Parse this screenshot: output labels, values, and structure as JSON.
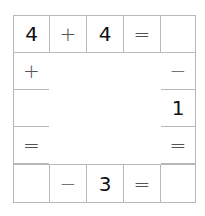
{
  "puzzle": {
    "type": "cross-math",
    "cells": {
      "r0c0": "4",
      "r0c1": "+",
      "r0c2": "4",
      "r0c3": "=",
      "r0c4": "",
      "r1c0": "+",
      "r1c4": "−",
      "r2c0": "",
      "r2c4": "1",
      "r3c0": "=",
      "r3c4": "=",
      "r4c0": "",
      "r4c1": "−",
      "r4c2": "3",
      "r4c3": "=",
      "r4c4": ""
    }
  }
}
